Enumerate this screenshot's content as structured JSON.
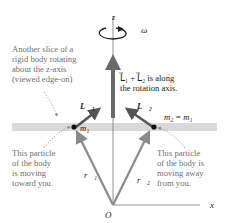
{
  "diagram": {
    "axis_z_label": "z",
    "axis_x_label": "x",
    "origin_label": "O",
    "omega_label": "ω",
    "annotation_slice": [
      "Another slice of a",
      "rigid body rotating",
      "about the z-axis",
      "(viewed edge-on)"
    ],
    "annotation_sum": [
      "L⃗₁ + L⃗₂ is along",
      "the rotation axis."
    ],
    "label_L1": "L⃗₁",
    "label_L2": "L⃗₂",
    "label_m1": "m₁",
    "label_m2_eq": "m₂ = m₁",
    "label_r1": "r⃗₁",
    "label_r2": "r⃗₂",
    "annotation_particle1": [
      "This particle",
      "of the body",
      "is moving",
      "toward you."
    ],
    "annotation_particle2": [
      "This particle",
      "of the body is",
      "moving away",
      "from you."
    ],
    "colors": {
      "slice_band": "#d9d9d9",
      "r_vector": "#8a8a8a",
      "L_vector": "#555555",
      "sum_vector": "#6a6a6a",
      "text_gray": "#6f6f6f",
      "text_dark": "#222222"
    }
  }
}
